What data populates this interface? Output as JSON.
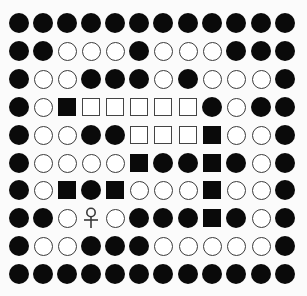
{
  "board": {
    "rows": 10,
    "cols": 12,
    "legend": {
      "B": "black-circle",
      "W": "white-circle",
      "S": "black-square",
      "Q": "white-square",
      "P": "player-ankh"
    },
    "grid": [
      "BBBBBBBBBBBB",
      "BBWWWBWWWBBB",
      "BWWBBBWBWWWB",
      "BWSQQQQQBWBB",
      "BWWBBQQQSWWB",
      "BWWWWSBBSBWB",
      "BWSBSWWWSWWB",
      "BBWPWBBBSBWB",
      "BWWBBBWWWWWB",
      "BBBBBBBBBBBB"
    ],
    "col_centers": [
      19,
      43,
      67,
      91,
      115,
      139,
      163,
      188,
      212,
      236,
      261,
      285
    ],
    "row_centers": [
      23,
      51,
      79,
      107,
      135,
      163,
      190,
      218,
      246,
      274
    ],
    "colors": {
      "black": "#0a0a0a",
      "white": "#ffffff",
      "outline": "#3a3a3a",
      "background": "#fbfbfb"
    }
  }
}
